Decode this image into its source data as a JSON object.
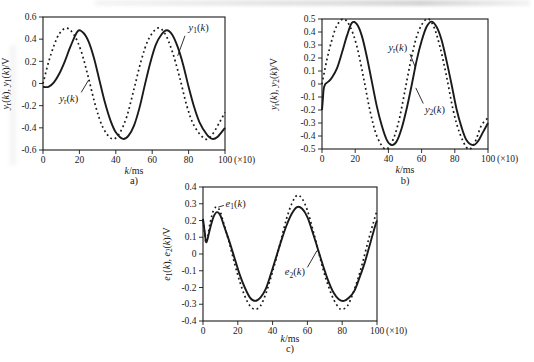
{
  "colors": {
    "ink": "#1a1a1a",
    "background": "#ffffff"
  },
  "chart_data": [
    {
      "id": "a",
      "type": "line",
      "caption": "a)",
      "xlabel": "k/ms",
      "ylabel": "y_r(k), y_1(k)/V",
      "xlim": [
        0,
        100
      ],
      "ylim": [
        -0.6,
        0.6
      ],
      "xticks": [
        0,
        20,
        40,
        60,
        80,
        100
      ],
      "xtick_suffix": "(×10)",
      "yticks": [
        0.6,
        0.4,
        0.2,
        0,
        -0.2,
        -0.4,
        -0.6
      ],
      "grid": false,
      "series": [
        {
          "name": "y_r(k)",
          "style": "dotted",
          "points": [
            [
              0,
              0
            ],
            [
              3,
              0.19
            ],
            [
              6,
              0.34
            ],
            [
              9,
              0.45
            ],
            [
              13,
              0.5
            ],
            [
              17,
              0.44
            ],
            [
              21,
              0.29
            ],
            [
              25,
              0.05
            ],
            [
              29,
              -0.21
            ],
            [
              33,
              -0.4
            ],
            [
              38,
              -0.5
            ],
            [
              42,
              -0.45
            ],
            [
              46,
              -0.3
            ],
            [
              50,
              -0.05
            ],
            [
              54,
              0.21
            ],
            [
              58,
              0.4
            ],
            [
              63,
              0.5
            ],
            [
              67,
              0.45
            ],
            [
              71,
              0.29
            ],
            [
              75,
              0.06
            ],
            [
              79,
              -0.2
            ],
            [
              83,
              -0.38
            ],
            [
              89,
              -0.5
            ],
            [
              93,
              -0.46
            ],
            [
              97,
              -0.35
            ],
            [
              100,
              -0.26
            ]
          ]
        },
        {
          "name": "y_1(k)",
          "style": "solid",
          "points": [
            [
              0,
              -0.03
            ],
            [
              3,
              -0.03
            ],
            [
              6,
              0.01
            ],
            [
              9,
              0.09
            ],
            [
              12,
              0.2
            ],
            [
              15,
              0.33
            ],
            [
              19,
              0.47
            ],
            [
              22,
              0.46
            ],
            [
              25,
              0.38
            ],
            [
              28,
              0.23
            ],
            [
              31,
              0.03
            ],
            [
              34,
              -0.17
            ],
            [
              37,
              -0.33
            ],
            [
              40,
              -0.44
            ],
            [
              44,
              -0.5
            ],
            [
              47,
              -0.47
            ],
            [
              50,
              -0.38
            ],
            [
              53,
              -0.22
            ],
            [
              56,
              -0.01
            ],
            [
              59,
              0.19
            ],
            [
              62,
              0.35
            ],
            [
              65,
              0.44
            ],
            [
              68,
              0.48
            ],
            [
              71,
              0.44
            ],
            [
              74,
              0.33
            ],
            [
              77,
              0.17
            ],
            [
              80,
              -0.03
            ],
            [
              83,
              -0.21
            ],
            [
              86,
              -0.35
            ],
            [
              90,
              -0.46
            ],
            [
              93,
              -0.5
            ],
            [
              96,
              -0.48
            ],
            [
              100,
              -0.4
            ]
          ]
        }
      ],
      "annotations": [
        {
          "text": "y_1(k)",
          "x": 80,
          "y": 0.5,
          "anchor": "start",
          "leader": [
            [
              78,
              0.43
            ],
            [
              74,
              0.25
            ]
          ]
        },
        {
          "text": "y_r(k)",
          "x": 9,
          "y": -0.14,
          "anchor": "start",
          "leader": [
            [
              21,
              -0.08
            ],
            [
              25,
              0.03
            ]
          ]
        }
      ]
    },
    {
      "id": "b",
      "type": "line",
      "caption": "b)",
      "xlabel": "k/ms",
      "ylabel": "y_r(k), y_2(k)/V",
      "xlim": [
        0,
        100
      ],
      "ylim": [
        -0.5,
        0.5
      ],
      "xticks": [
        0,
        20,
        40,
        60,
        80,
        100
      ],
      "xtick_suffix": "(×10)",
      "yticks": [
        0.5,
        0.4,
        0.3,
        0.2,
        0.1,
        0,
        -0.1,
        -0.2,
        -0.3,
        -0.4,
        -0.5
      ],
      "grid": false,
      "series": [
        {
          "name": "y_r(k)",
          "style": "dotted",
          "points": [
            [
              0,
              0
            ],
            [
              3,
              0.19
            ],
            [
              6,
              0.34
            ],
            [
              9,
              0.45
            ],
            [
              13,
              0.5
            ],
            [
              17,
              0.44
            ],
            [
              21,
              0.29
            ],
            [
              25,
              0.05
            ],
            [
              29,
              -0.21
            ],
            [
              33,
              -0.4
            ],
            [
              38,
              -0.5
            ],
            [
              42,
              -0.45
            ],
            [
              46,
              -0.3
            ],
            [
              50,
              -0.05
            ],
            [
              54,
              0.21
            ],
            [
              58,
              0.4
            ],
            [
              63,
              0.5
            ],
            [
              67,
              0.45
            ],
            [
              71,
              0.29
            ],
            [
              75,
              0.06
            ],
            [
              79,
              -0.2
            ],
            [
              83,
              -0.38
            ],
            [
              88,
              -0.5
            ],
            [
              92,
              -0.45
            ],
            [
              96,
              -0.32
            ],
            [
              100,
              -0.26
            ]
          ]
        },
        {
          "name": "y_2(k)",
          "style": "solid",
          "points": [
            [
              0,
              -0.2
            ],
            [
              0.5,
              -0.12
            ],
            [
              1,
              -0.04
            ],
            [
              2,
              0
            ],
            [
              4,
              0.02
            ],
            [
              6,
              0.05
            ],
            [
              9,
              0.12
            ],
            [
              12,
              0.24
            ],
            [
              15,
              0.37
            ],
            [
              18,
              0.47
            ],
            [
              21,
              0.46
            ],
            [
              24,
              0.37
            ],
            [
              27,
              0.21
            ],
            [
              30,
              0.02
            ],
            [
              33,
              -0.17
            ],
            [
              36,
              -0.32
            ],
            [
              39,
              -0.43
            ],
            [
              42,
              -0.47
            ],
            [
              45,
              -0.44
            ],
            [
              48,
              -0.34
            ],
            [
              51,
              -0.19
            ],
            [
              54,
              -0.01
            ],
            [
              57,
              0.18
            ],
            [
              60,
              0.33
            ],
            [
              63,
              0.44
            ],
            [
              66,
              0.48
            ],
            [
              69,
              0.44
            ],
            [
              72,
              0.34
            ],
            [
              75,
              0.18
            ],
            [
              78,
              0
            ],
            [
              81,
              -0.19
            ],
            [
              84,
              -0.33
            ],
            [
              87,
              -0.43
            ],
            [
              91,
              -0.47
            ],
            [
              94,
              -0.44
            ],
            [
              97,
              -0.37
            ],
            [
              100,
              -0.3
            ]
          ]
        }
      ],
      "annotations": [
        {
          "text": "y_r(k)",
          "x": 40,
          "y": 0.28,
          "anchor": "start",
          "leader": [
            [
              53,
              0.23
            ],
            [
              56.5,
              0.12
            ]
          ]
        },
        {
          "text": "y_2(k)",
          "x": 62,
          "y": -0.2,
          "anchor": "start",
          "leader": [
            [
              61,
              -0.15
            ],
            [
              56.5,
              -0.03
            ]
          ]
        }
      ]
    },
    {
      "id": "c",
      "type": "line",
      "caption": "c)",
      "xlabel": "k/ms",
      "ylabel": "e_1(k), e_2(k)/V",
      "xlim": [
        0,
        100
      ],
      "ylim": [
        -0.4,
        0.4
      ],
      "xticks": [
        0,
        20,
        40,
        60,
        80,
        100
      ],
      "xtick_suffix": "(×10)",
      "yticks": [
        0.4,
        0.3,
        0.2,
        0.1,
        0,
        -0.1,
        -0.2,
        -0.3,
        -0.4
      ],
      "grid": false,
      "series": [
        {
          "name": "e_1(k)",
          "style": "dotted",
          "points": [
            [
              0,
              0.2
            ],
            [
              1,
              0.12
            ],
            [
              2,
              0.07
            ],
            [
              4,
              0.18
            ],
            [
              6,
              0.26
            ],
            [
              8,
              0.28
            ],
            [
              10,
              0.25
            ],
            [
              12,
              0.18
            ],
            [
              15,
              0.07
            ],
            [
              18,
              -0.05
            ],
            [
              21,
              -0.16
            ],
            [
              24,
              -0.25
            ],
            [
              27,
              -0.31
            ],
            [
              30,
              -0.33
            ],
            [
              33,
              -0.31
            ],
            [
              36,
              -0.24
            ],
            [
              39,
              -0.14
            ],
            [
              42,
              -0.03
            ],
            [
              45,
              0.09
            ],
            [
              48,
              0.21
            ],
            [
              51,
              0.3
            ],
            [
              54,
              0.35
            ],
            [
              57,
              0.33
            ],
            [
              60,
              0.26
            ],
            [
              63,
              0.15
            ],
            [
              66,
              0.03
            ],
            [
              69,
              -0.09
            ],
            [
              72,
              -0.19
            ],
            [
              75,
              -0.27
            ],
            [
              78,
              -0.32
            ],
            [
              80,
              -0.33
            ],
            [
              83,
              -0.31
            ],
            [
              86,
              -0.24
            ],
            [
              89,
              -0.15
            ],
            [
              92,
              -0.04
            ],
            [
              95,
              0.08
            ],
            [
              98,
              0.19
            ],
            [
              100,
              0.26
            ]
          ]
        },
        {
          "name": "e_2(k)",
          "style": "solid",
          "points": [
            [
              0,
              0.21
            ],
            [
              1,
              0.13
            ],
            [
              2,
              0.07
            ],
            [
              4,
              0.15
            ],
            [
              6,
              0.22
            ],
            [
              8,
              0.25
            ],
            [
              10,
              0.23
            ],
            [
              12,
              0.17
            ],
            [
              15,
              0.08
            ],
            [
              18,
              -0.02
            ],
            [
              21,
              -0.12
            ],
            [
              24,
              -0.2
            ],
            [
              27,
              -0.26
            ],
            [
              30,
              -0.28
            ],
            [
              33,
              -0.26
            ],
            [
              36,
              -0.21
            ],
            [
              39,
              -0.12
            ],
            [
              42,
              -0.02
            ],
            [
              45,
              0.08
            ],
            [
              48,
              0.17
            ],
            [
              51,
              0.24
            ],
            [
              54,
              0.28
            ],
            [
              57,
              0.27
            ],
            [
              60,
              0.22
            ],
            [
              63,
              0.13
            ],
            [
              66,
              0.03
            ],
            [
              69,
              -0.07
            ],
            [
              72,
              -0.16
            ],
            [
              75,
              -0.23
            ],
            [
              78,
              -0.27
            ],
            [
              81,
              -0.28
            ],
            [
              84,
              -0.26
            ],
            [
              87,
              -0.22
            ],
            [
              90,
              -0.14
            ],
            [
              93,
              -0.05
            ],
            [
              96,
              0.06
            ],
            [
              99,
              0.17
            ],
            [
              100,
              0.2
            ]
          ]
        }
      ],
      "annotations": [
        {
          "text": "e_1(k)",
          "x": 13,
          "y": 0.3,
          "anchor": "start",
          "leader": [
            [
              12,
              0.29
            ],
            [
              8.8,
              0.28
            ]
          ]
        },
        {
          "text": "e_2(k)",
          "x": 47,
          "y": -0.11,
          "anchor": "start",
          "leader": [
            [
              60,
              -0.08
            ],
            [
              65.5,
              0.02
            ]
          ]
        }
      ]
    }
  ]
}
